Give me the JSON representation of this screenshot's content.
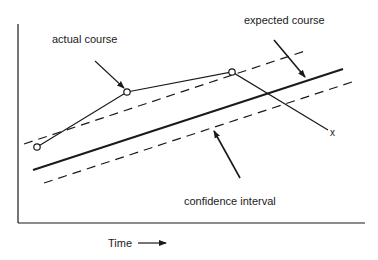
{
  "diagram": {
    "title": "",
    "labels": {
      "actual_course": "actual course",
      "expected_course": "expected course",
      "confidence_interval": "confidence interval",
      "end_marker": "x",
      "x_axis": "Time"
    },
    "series": {
      "expected_course": {
        "style": "solid",
        "from": [
          33,
          170
        ],
        "to": [
          343,
          69
        ]
      },
      "upper_bound": {
        "style": "dashed",
        "from": [
          24,
          144
        ],
        "to": [
          308,
          50
        ]
      },
      "lower_bound": {
        "style": "dashed",
        "from": [
          44,
          183
        ],
        "to": [
          352,
          82
        ]
      },
      "actual_course_points": [
        [
          37,
          147
        ],
        [
          127,
          92
        ],
        [
          232,
          72
        ],
        [
          328,
          130
        ]
      ]
    },
    "colors": {
      "line": "#1a1a1a",
      "background": "#ffffff"
    }
  }
}
